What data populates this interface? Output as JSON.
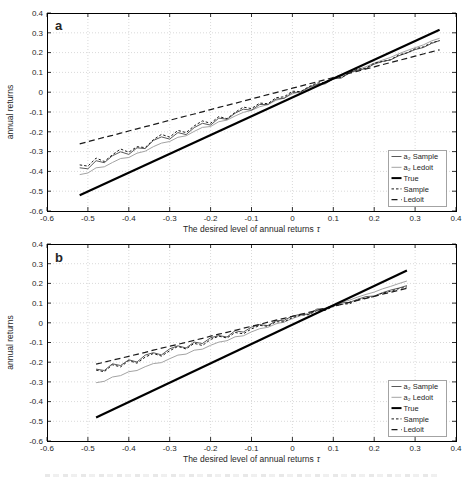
{
  "figure": {
    "background": "#ffffff",
    "axis_color": "#262626",
    "grid_color": "#cfcfcf",
    "legend_border_color": "#8c8c8c"
  },
  "chart_data": [
    {
      "type": "line",
      "panel_label": "a",
      "xlabel": "The desired level of annual returns",
      "xlabel_symbol": "τ",
      "ylabel": "annual returns",
      "xlim": [
        -0.6,
        0.4
      ],
      "ylim": [
        -0.6,
        0.4
      ],
      "xticks": [
        -0.6,
        -0.5,
        -0.4,
        -0.3,
        -0.2,
        -0.1,
        0,
        0.1,
        0.2,
        0.3,
        0.4
      ],
      "xtick_labels": [
        "-0.6",
        "-0.5",
        "-0.4",
        "-0.3",
        "-0.2",
        "-0.1",
        "0",
        "0.1",
        "0.2",
        "0.3",
        "0.4"
      ],
      "yticks": [
        -0.6,
        -0.5,
        -0.4,
        -0.3,
        -0.2,
        -0.1,
        0,
        0.1,
        0.2,
        0.3,
        0.4
      ],
      "ytick_labels": [
        "-0.6",
        "-0.5",
        "-0.4",
        "-0.3",
        "-0.2",
        "-0.1",
        "0",
        "0.1",
        "0.2",
        "0.3",
        "0.4"
      ],
      "grid": true,
      "legend_position": "lower right",
      "series": [
        {
          "name": "a₂ Sample",
          "style": "thin-solid",
          "color": "#595959",
          "width": 1,
          "x_start": -0.52,
          "x_step": 0.02,
          "y": [
            -0.382,
            -0.387,
            -0.346,
            -0.356,
            -0.321,
            -0.301,
            -0.314,
            -0.281,
            -0.285,
            -0.244,
            -0.226,
            -0.237,
            -0.204,
            -0.214,
            -0.179,
            -0.157,
            -0.166,
            -0.131,
            -0.137,
            -0.106,
            -0.086,
            -0.091,
            -0.062,
            -0.062,
            -0.035,
            -0.031,
            -0.002,
            0.001,
            0.025,
            0.04,
            0.042,
            0.067,
            0.072,
            0.098,
            0.111,
            0.119,
            0.142,
            0.155,
            0.163,
            0.184,
            0.198,
            0.215,
            0.226,
            0.246,
            0.261
          ]
        },
        {
          "name": "a₂ Ledoit",
          "style": "thin-solid",
          "color": "#a3a3a3",
          "width": 1,
          "x_start": -0.52,
          "x_step": 0.02,
          "y": [
            -0.416,
            -0.408,
            -0.382,
            -0.377,
            -0.355,
            -0.335,
            -0.33,
            -0.308,
            -0.298,
            -0.275,
            -0.257,
            -0.249,
            -0.228,
            -0.22,
            -0.198,
            -0.178,
            -0.173,
            -0.149,
            -0.141,
            -0.12,
            -0.102,
            -0.092,
            -0.073,
            -0.063,
            -0.041,
            -0.03,
            -0.008,
            0.002,
            0.021,
            0.037,
            0.049,
            0.068,
            0.08,
            0.1,
            0.115,
            0.129,
            0.147,
            0.162,
            0.176,
            0.194,
            0.21,
            0.225,
            0.239,
            0.259,
            0.272
          ]
        },
        {
          "name": "True",
          "style": "thick-solid",
          "color": "#000000",
          "width": 2.2,
          "x": [
            -0.52,
            0.36
          ],
          "y": [
            -0.52,
            0.315
          ]
        },
        {
          "name": "Sample",
          "style": "dash-dot",
          "color": "#1a1a1a",
          "width": 1,
          "dash": "2.5,2",
          "x_start": -0.52,
          "x_step": 0.02,
          "y": [
            -0.367,
            -0.373,
            -0.333,
            -0.35,
            -0.316,
            -0.287,
            -0.303,
            -0.275,
            -0.28,
            -0.24,
            -0.213,
            -0.227,
            -0.193,
            -0.204,
            -0.17,
            -0.145,
            -0.157,
            -0.123,
            -0.134,
            -0.102,
            -0.075,
            -0.083,
            -0.055,
            -0.058,
            -0.028,
            -0.023,
            0.005,
            0.003,
            0.028,
            0.046,
            0.049,
            0.073,
            0.073,
            0.1,
            0.116,
            0.121,
            0.147,
            0.155,
            0.164,
            0.188,
            0.199,
            0.219,
            0.229,
            0.25,
            0.26
          ]
        },
        {
          "name": "Ledoit",
          "style": "dashed",
          "color": "#1a1a1a",
          "width": 1.2,
          "dash": "6,3.5",
          "x_start": -0.52,
          "x_step": 0.02,
          "y": [
            -0.261,
            -0.25,
            -0.239,
            -0.228,
            -0.218,
            -0.207,
            -0.196,
            -0.185,
            -0.174,
            -0.164,
            -0.153,
            -0.142,
            -0.131,
            -0.12,
            -0.11,
            -0.099,
            -0.088,
            -0.077,
            -0.066,
            -0.056,
            -0.045,
            -0.034,
            -0.023,
            -0.012,
            -0.002,
            0.009,
            0.02,
            0.031,
            0.042,
            0.052,
            0.063,
            0.074,
            0.085,
            0.096,
            0.106,
            0.117,
            0.128,
            0.139,
            0.15,
            0.16,
            0.171,
            0.182,
            0.193,
            0.204,
            0.214
          ]
        }
      ]
    },
    {
      "type": "line",
      "panel_label": "b",
      "xlabel": "The desired level of annual returns",
      "xlabel_symbol": "τ",
      "ylabel": "annual returns",
      "xlim": [
        -0.6,
        0.4
      ],
      "ylim": [
        -0.6,
        0.4
      ],
      "xticks": [
        -0.6,
        -0.5,
        -0.4,
        -0.3,
        -0.2,
        -0.1,
        0,
        0.1,
        0.2,
        0.3,
        0.4
      ],
      "xtick_labels": [
        "-0.6",
        "-0.5",
        "-0.4",
        "-0.3",
        "-0.2",
        "-0.1",
        "0",
        "0.1",
        "0.2",
        "0.3",
        "0.4"
      ],
      "yticks": [
        -0.6,
        -0.5,
        -0.4,
        -0.3,
        -0.2,
        -0.1,
        0,
        0.1,
        0.2,
        0.3,
        0.4
      ],
      "ytick_labels": [
        "-0.6",
        "-0.5",
        "-0.4",
        "-0.3",
        "-0.2",
        "-0.1",
        "0",
        "0.1",
        "0.2",
        "0.3",
        "0.4"
      ],
      "grid": true,
      "legend_position": "lower right",
      "series": [
        {
          "name": "a₂ Sample",
          "style": "thin-solid",
          "color": "#595959",
          "width": 1,
          "x_start": -0.48,
          "x_step": 0.02,
          "y": [
            -0.235,
            -0.242,
            -0.208,
            -0.217,
            -0.188,
            -0.199,
            -0.164,
            -0.152,
            -0.163,
            -0.132,
            -0.117,
            -0.128,
            -0.098,
            -0.105,
            -0.076,
            -0.065,
            -0.072,
            -0.04,
            -0.047,
            -0.022,
            -0.009,
            -0.014,
            0.01,
            0.013,
            0.034,
            0.043,
            0.044,
            0.07,
            0.071,
            0.086,
            0.101,
            0.104,
            0.12,
            0.133,
            0.136,
            0.153,
            0.166,
            0.176,
            0.189
          ]
        },
        {
          "name": "a₂ Ledoit",
          "style": "thin-solid",
          "color": "#a3a3a3",
          "width": 1,
          "x_start": -0.48,
          "x_step": 0.02,
          "y": [
            -0.304,
            -0.297,
            -0.275,
            -0.268,
            -0.248,
            -0.242,
            -0.223,
            -0.207,
            -0.202,
            -0.182,
            -0.164,
            -0.159,
            -0.139,
            -0.134,
            -0.114,
            -0.098,
            -0.091,
            -0.071,
            -0.066,
            -0.046,
            -0.03,
            -0.023,
            -0.005,
            0.004,
            0.022,
            0.036,
            0.045,
            0.065,
            0.074,
            0.09,
            0.104,
            0.115,
            0.131,
            0.144,
            0.156,
            0.172,
            0.185,
            0.199,
            0.212
          ]
        },
        {
          "name": "True",
          "style": "thick-solid",
          "color": "#000000",
          "width": 2.2,
          "x": [
            -0.48,
            0.28
          ],
          "y": [
            -0.48,
            0.265
          ]
        },
        {
          "name": "Sample",
          "style": "dash-dot",
          "color": "#1a1a1a",
          "width": 1,
          "dash": "2.5,2",
          "x_start": -0.48,
          "x_step": 0.02,
          "y": [
            -0.24,
            -0.248,
            -0.213,
            -0.224,
            -0.192,
            -0.205,
            -0.174,
            -0.156,
            -0.169,
            -0.142,
            -0.12,
            -0.133,
            -0.104,
            -0.115,
            -0.085,
            -0.068,
            -0.077,
            -0.049,
            -0.056,
            -0.031,
            -0.013,
            -0.018,
            0.005,
            0.005,
            0.026,
            0.039,
            0.041,
            0.062,
            0.063,
            0.083,
            0.094,
            0.097,
            0.117,
            0.126,
            0.133,
            0.151,
            0.16,
            0.173,
            0.182
          ]
        },
        {
          "name": "Ledoit",
          "style": "dashed",
          "color": "#1a1a1a",
          "width": 1.2,
          "dash": "6,3.5",
          "x_start": -0.48,
          "x_step": 0.02,
          "y": [
            -0.21,
            -0.2,
            -0.19,
            -0.18,
            -0.17,
            -0.16,
            -0.15,
            -0.139,
            -0.129,
            -0.119,
            -0.109,
            -0.099,
            -0.089,
            -0.079,
            -0.068,
            -0.058,
            -0.048,
            -0.038,
            -0.028,
            -0.018,
            -0.008,
            0.003,
            0.013,
            0.023,
            0.033,
            0.043,
            0.053,
            0.063,
            0.074,
            0.084,
            0.094,
            0.104,
            0.114,
            0.124,
            0.134,
            0.145,
            0.155,
            0.165,
            0.175
          ]
        }
      ]
    }
  ]
}
